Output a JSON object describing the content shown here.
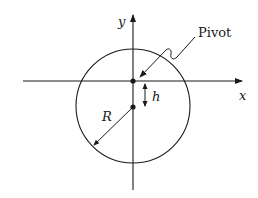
{
  "diagram": {
    "axes": {
      "x_label": "x",
      "y_label": "y"
    },
    "labels": {
      "pivot": "Pivot",
      "offset": "h",
      "radius": "R"
    },
    "colors": {
      "stroke": "#1a1a1a",
      "background": "#ffffff"
    }
  }
}
